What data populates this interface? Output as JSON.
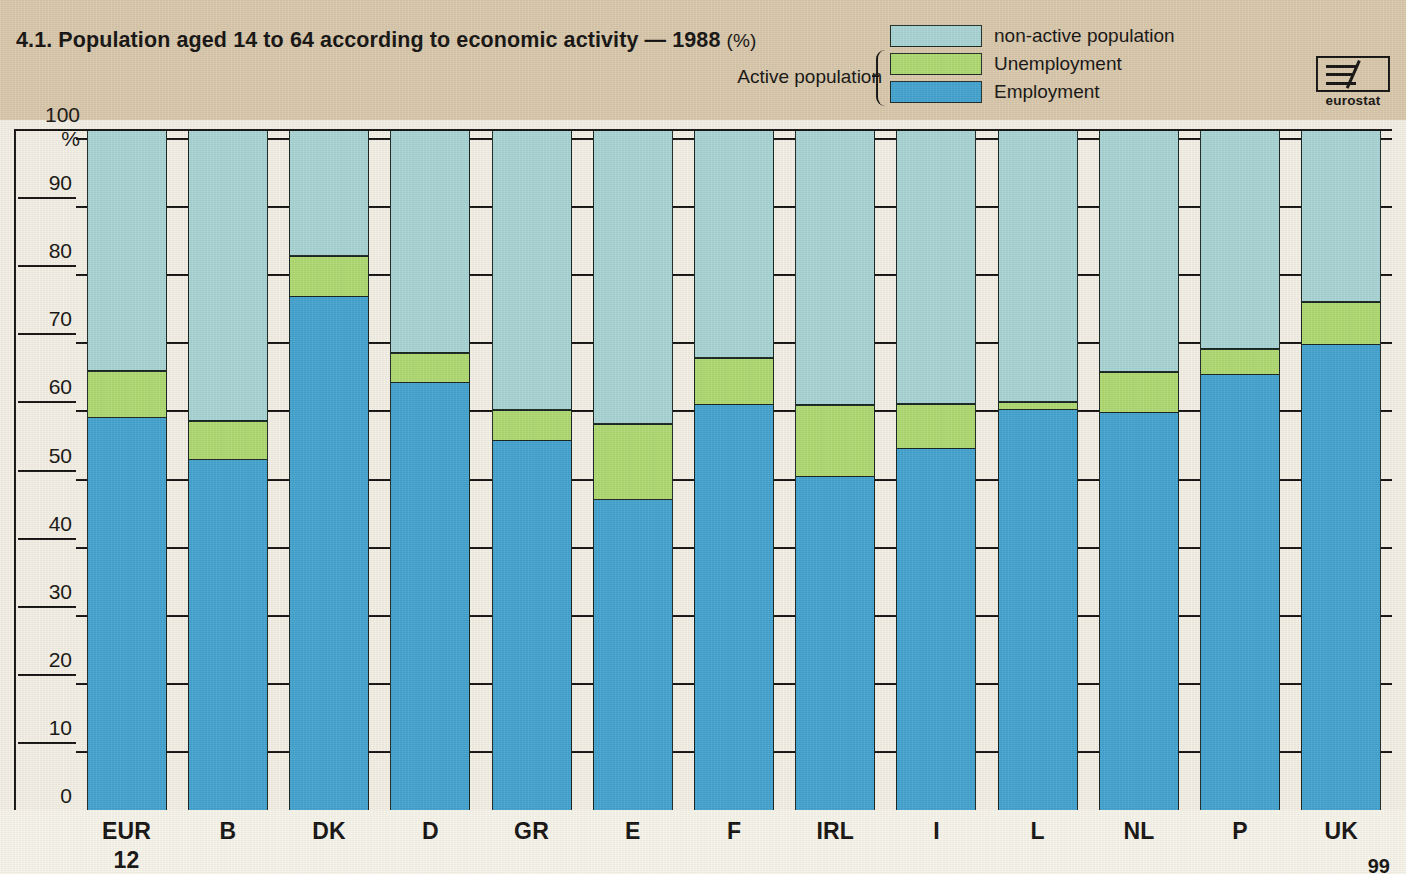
{
  "title": {
    "main": "4.1. Population aged 14 to 64 according to economic activity — 1988",
    "unit": "(%)"
  },
  "legend": {
    "group_label": "Active population",
    "items": [
      {
        "label": "non-active population",
        "color": "#a8d3d4",
        "key": "non_active"
      },
      {
        "label": "Unemployment",
        "color": "#aed86f",
        "key": "unemployment"
      },
      {
        "label": "Employment",
        "color": "#42a2ce",
        "key": "employment"
      }
    ]
  },
  "logo": {
    "name": "eurostat-logo",
    "text": "eurostat"
  },
  "axis": {
    "y_top_label": "100 %",
    "y_ticks": [
      "100 %",
      "90",
      "80",
      "70",
      "60",
      "50",
      "40",
      "30",
      "20",
      "10",
      "0"
    ]
  },
  "page_number": "99",
  "chart_data": {
    "type": "bar",
    "title": "4.1. Population aged 14 to 64 according to economic activity — 1988 (%)",
    "xlabel": "",
    "ylabel": "%",
    "ylim": [
      0,
      100
    ],
    "grid": true,
    "stacked": true,
    "legend_position": "top-right",
    "categories": [
      "EUR 12",
      "B",
      "DK",
      "D",
      "GR",
      "E",
      "F",
      "IRL",
      "I",
      "L",
      "NL",
      "P",
      "UK"
    ],
    "category_lines": [
      [
        "EUR",
        "12"
      ],
      [
        "B"
      ],
      [
        "DK"
      ],
      [
        "D"
      ],
      [
        "GR"
      ],
      [
        "E"
      ],
      [
        "F"
      ],
      [
        "IRL"
      ],
      [
        "I"
      ],
      [
        "L"
      ],
      [
        "NL"
      ],
      [
        "P"
      ],
      [
        "UK"
      ]
    ],
    "series": [
      {
        "name": "Employment",
        "color": "#42a2ce",
        "values": [
          57.6,
          51.4,
          75.3,
          62.7,
          54.2,
          45.5,
          59.5,
          48.9,
          53.0,
          58.7,
          58.3,
          63.9,
          68.3
        ]
      },
      {
        "name": "Unemployment",
        "color": "#aed86f",
        "values": [
          6.9,
          5.7,
          6.0,
          4.4,
          4.5,
          11.2,
          6.9,
          10.6,
          6.6,
          1.2,
          6.0,
          3.8,
          6.3
        ]
      },
      {
        "name": "non-active population",
        "color": "#a8d3d4",
        "values": [
          35.5,
          42.9,
          18.7,
          32.9,
          41.3,
          43.3,
          33.6,
          40.5,
          40.4,
          40.1,
          35.7,
          32.3,
          25.4
        ]
      }
    ],
    "active_population_totals": [
      64.5,
      57.1,
      81.3,
      67.1,
      58.7,
      56.7,
      66.4,
      59.5,
      59.6,
      59.9,
      64.3,
      67.7,
      74.6
    ],
    "yticks": [
      0,
      10,
      20,
      30,
      40,
      50,
      60,
      70,
      80,
      90,
      100
    ]
  }
}
